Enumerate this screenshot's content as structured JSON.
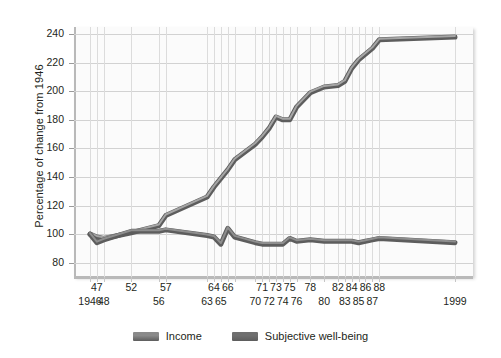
{
  "chart_data": {
    "type": "line",
    "title": "",
    "xlabel": "",
    "ylabel": "Percentage of change from 1946",
    "ylim": [
      70,
      245
    ],
    "yticks": [
      80,
      100,
      120,
      140,
      160,
      180,
      200,
      220,
      240
    ],
    "grid": true,
    "legend_position": "bottom-center",
    "xtick_labels_row1": [
      "47",
      "52",
      "57",
      "64",
      "66",
      "71",
      "73",
      "75",
      "78",
      "82",
      "84",
      "86",
      "88"
    ],
    "xtick_labels_row2": [
      "1946",
      "48",
      "56",
      "63",
      "65",
      "70",
      "72",
      "74",
      "76",
      "80",
      "83",
      "85",
      "87",
      "1999"
    ],
    "x": [
      1946,
      1947,
      1948,
      1952,
      1956,
      1957,
      1963,
      1964,
      1965,
      1966,
      1967,
      1970,
      1971,
      1972,
      1973,
      1974,
      1975,
      1976,
      1978,
      1980,
      1982,
      1983,
      1984,
      1985,
      1986,
      1987,
      1988,
      1999
    ],
    "series": [
      {
        "name": "Income",
        "color": "#8a8a8a",
        "values": [
          100,
          98,
          97,
          101,
          106,
          113,
          126,
          133,
          139,
          145,
          152,
          163,
          168,
          174,
          182,
          180,
          180,
          189,
          199,
          203,
          204,
          207,
          216,
          222,
          226,
          230,
          236,
          238
        ]
      },
      {
        "name": "Subjective well-being",
        "color": "#6f6f6f",
        "values": [
          100,
          94,
          96,
          102,
          102,
          103,
          99,
          98,
          93,
          104,
          98,
          94,
          93,
          93,
          93,
          93,
          97,
          95,
          96,
          95,
          95,
          95,
          95,
          94,
          95,
          96,
          97,
          94
        ]
      }
    ]
  },
  "legend": {
    "items": [
      {
        "label": "Income",
        "color": "#8a8a8a"
      },
      {
        "label": "Subjective well-being",
        "color": "#6f6f6f"
      }
    ]
  }
}
